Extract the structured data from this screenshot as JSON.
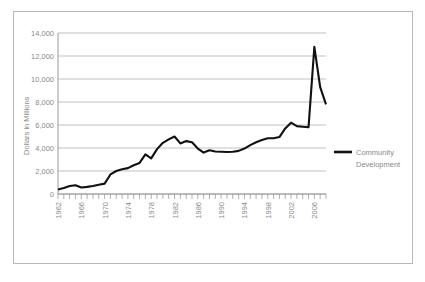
{
  "chart_data": {
    "type": "line",
    "title": "",
    "subtitle": "",
    "xlabel": "",
    "ylabel": "Dollars in Millions",
    "ylim": [
      0,
      14000
    ],
    "xlim": [
      1962,
      2008
    ],
    "grid": true,
    "legend_position": "right",
    "y_ticks": [
      "0",
      "2,000",
      "4,000",
      "6,000",
      "8,000",
      "10,000",
      "12,000",
      "14,000"
    ],
    "y_tick_values": [
      0,
      2000,
      4000,
      6000,
      8000,
      10000,
      12000,
      14000
    ],
    "x_tick_labels": [
      "1962",
      "1966",
      "1970",
      "1974",
      "1978",
      "1982",
      "1986",
      "1990",
      "1994",
      "1998",
      "2002",
      "2006"
    ],
    "x_tick_values": [
      1962,
      1966,
      1970,
      1974,
      1978,
      1982,
      1986,
      1990,
      1994,
      1998,
      2002,
      2006
    ],
    "categories": [
      1962,
      1963,
      1964,
      1965,
      1966,
      1967,
      1968,
      1969,
      1970,
      1971,
      1972,
      1973,
      1974,
      1975,
      1976,
      1977,
      1978,
      1979,
      1980,
      1981,
      1982,
      1983,
      1984,
      1985,
      1986,
      1987,
      1988,
      1989,
      1990,
      1991,
      1992,
      1993,
      1994,
      1995,
      1996,
      1997,
      1998,
      1999,
      2000,
      2001,
      2002,
      2003,
      2004,
      2005,
      2006,
      2007,
      2008
    ],
    "series": [
      {
        "name": "Community Development",
        "color": "#111111",
        "values": [
          400,
          520,
          700,
          760,
          560,
          620,
          700,
          800,
          900,
          1700,
          2000,
          2150,
          2250,
          2500,
          2700,
          3450,
          3100,
          3900,
          4450,
          4750,
          5000,
          4400,
          4600,
          4500,
          3950,
          3600,
          3800,
          3700,
          3680,
          3650,
          3680,
          3750,
          3950,
          4250,
          4500,
          4700,
          4850,
          4850,
          4950,
          5700,
          6200,
          5900,
          5850,
          5800,
          12800,
          9300,
          7800
        ]
      }
    ],
    "legend": [
      {
        "label_line1": "Community",
        "label_line2": "Development",
        "color": "#111111"
      }
    ]
  }
}
